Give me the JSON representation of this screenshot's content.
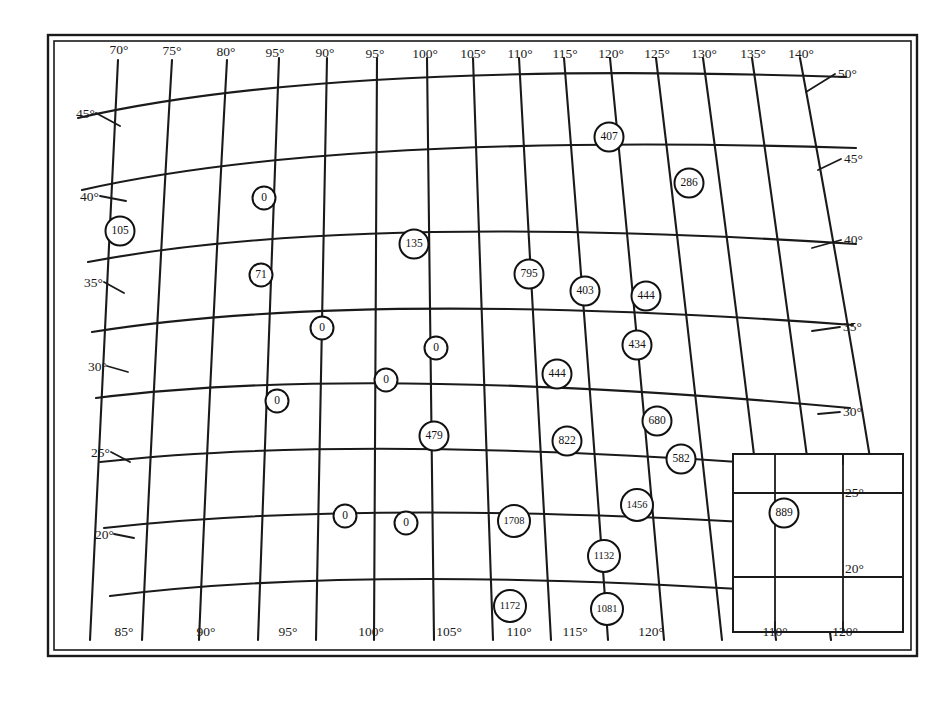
{
  "figure": {
    "type": "map",
    "background_color": "#ffffff",
    "line_color": "#1a1a1a",
    "marker_fill": "#ffffff"
  },
  "graticule": {
    "longitude_labels_top": [
      "70°",
      "75°",
      "80°",
      "95°",
      "90°",
      "95°",
      "100°",
      "105°",
      "110°",
      "115°",
      "120°",
      "125°",
      "130°",
      "135°",
      "140°"
    ],
    "longitude_labels_bottom": [
      "85°",
      "90°",
      "95°",
      "100°",
      "105°",
      "110°",
      "115°",
      "120°"
    ],
    "latitude_labels_left": [
      "45°",
      "40°",
      "35°",
      "30°",
      "25°",
      "20°"
    ],
    "latitude_labels_right": [
      "50°",
      "45°",
      "40°",
      "35°",
      "30°",
      "25°",
      "20°"
    ]
  },
  "inset": {
    "latitude_labels": [
      "25°",
      "20°"
    ],
    "longitude_labels": [
      "110°",
      "120°"
    ]
  },
  "chart_data": {
    "type": "scatter",
    "title": "",
    "xlabel": "Longitude (°E)",
    "ylabel": "Latitude (°N)",
    "markers": [
      {
        "label": "105",
        "x": 120,
        "y": 231
      },
      {
        "label": "0",
        "x": 264,
        "y": 198
      },
      {
        "label": "71",
        "x": 261,
        "y": 275
      },
      {
        "label": "135",
        "x": 414,
        "y": 244
      },
      {
        "label": "795",
        "x": 529,
        "y": 274
      },
      {
        "label": "403",
        "x": 585,
        "y": 291
      },
      {
        "label": "444",
        "x": 646,
        "y": 296
      },
      {
        "label": "407",
        "x": 609,
        "y": 137
      },
      {
        "label": "286",
        "x": 689,
        "y": 183
      },
      {
        "label": "0",
        "x": 322,
        "y": 328
      },
      {
        "label": "0",
        "x": 436,
        "y": 348
      },
      {
        "label": "434",
        "x": 637,
        "y": 345
      },
      {
        "label": "0",
        "x": 277,
        "y": 401
      },
      {
        "label": "0",
        "x": 386,
        "y": 380
      },
      {
        "label": "444",
        "x": 557,
        "y": 374
      },
      {
        "label": "680",
        "x": 657,
        "y": 421
      },
      {
        "label": "479",
        "x": 434,
        "y": 436
      },
      {
        "label": "822",
        "x": 567,
        "y": 441
      },
      {
        "label": "582",
        "x": 681,
        "y": 459
      },
      {
        "label": "0",
        "x": 345,
        "y": 516
      },
      {
        "label": "0",
        "x": 406,
        "y": 523
      },
      {
        "label": "1708",
        "x": 514,
        "y": 521
      },
      {
        "label": "1456",
        "x": 637,
        "y": 505
      },
      {
        "label": "889",
        "x": 784,
        "y": 513
      },
      {
        "label": "1132",
        "x": 604,
        "y": 556
      },
      {
        "label": "1172",
        "x": 510,
        "y": 606
      },
      {
        "label": "1081",
        "x": 607,
        "y": 609
      }
    ],
    "value_min": 0,
    "value_max": 1708,
    "count": 27,
    "legend": [],
    "grid": true
  }
}
